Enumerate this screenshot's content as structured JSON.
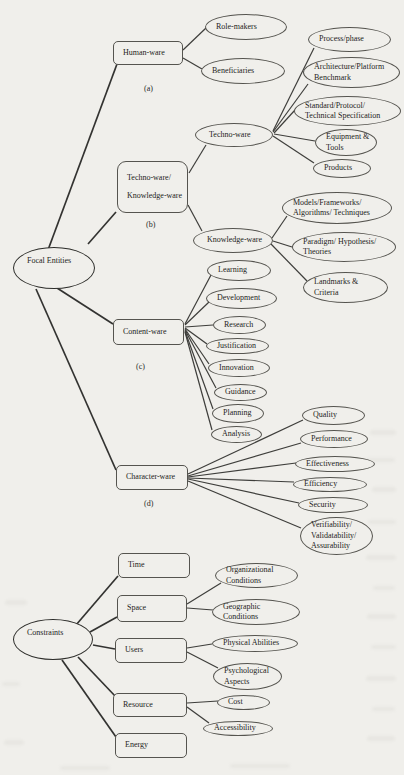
{
  "focal_entities": {
    "label": "Focal Entities",
    "branches": [
      {
        "label": "Human-ware",
        "tag": "(a)",
        "children": [
          {
            "label": "Role-makers"
          },
          {
            "label": "Beneficiaries"
          }
        ]
      },
      {
        "label": "Techno-ware/\nKnowledge-ware",
        "tag": "(b)",
        "children": [
          {
            "label": "Techno-ware",
            "children": [
              {
                "label": "Process/phase"
              },
              {
                "label": "Architecture/Platform\nBenchmark"
              },
              {
                "label": "Standard/Protocol/\nTechnical Specification"
              },
              {
                "label": "Equipment &\nTools"
              },
              {
                "label": "Products"
              }
            ]
          },
          {
            "label": "Knowledge-ware",
            "children": [
              {
                "label": "Models/Frameworks/\nAlgorithms/ Techniques"
              },
              {
                "label": "Paradigm/ Hypothesis/\nTheories"
              },
              {
                "label": "Landmarks &\nCriteria"
              }
            ]
          }
        ]
      },
      {
        "label": "Content-ware",
        "tag": "(c)",
        "children": [
          {
            "label": "Learning"
          },
          {
            "label": "Development"
          },
          {
            "label": "Research"
          },
          {
            "label": "Justification"
          },
          {
            "label": "Innovation"
          },
          {
            "label": "Guidance"
          },
          {
            "label": "Planning"
          },
          {
            "label": "Analysis"
          }
        ]
      },
      {
        "label": "Character-ware",
        "tag": "(d)",
        "children": [
          {
            "label": "Quality"
          },
          {
            "label": "Performance"
          },
          {
            "label": "Effectiveness"
          },
          {
            "label": "Efficiency"
          },
          {
            "label": "Security"
          },
          {
            "label": "Verifiability/\nValidatability/\nAssurability"
          }
        ]
      }
    ]
  },
  "constraints": {
    "label": "Constraints",
    "branches": [
      {
        "label": "Time",
        "children": []
      },
      {
        "label": "Space",
        "children": [
          {
            "label": "Organizational\nConditions"
          },
          {
            "label": "Geographic\nConditions"
          }
        ]
      },
      {
        "label": "Users",
        "children": [
          {
            "label": "Physical Abilities"
          },
          {
            "label": "Psychological\nAspects"
          }
        ]
      },
      {
        "label": "Resource",
        "children": [
          {
            "label": "Cost"
          },
          {
            "label": "Accessibility"
          }
        ]
      },
      {
        "label": "Energy",
        "children": []
      }
    ]
  },
  "colors": {
    "background": "#f0efeb",
    "line": "#3e3e3b",
    "border": "#55544f",
    "text": "#1d1d1b"
  }
}
